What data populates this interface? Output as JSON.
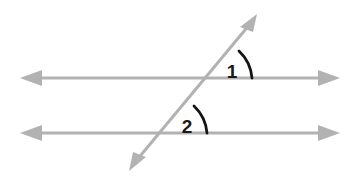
{
  "figure": {
    "width": 356,
    "height": 180,
    "background_color": "#ffffff",
    "line_color": "#b2b2b2",
    "arc_color": "#141414",
    "label_color": "#1a1a1a"
  },
  "lines": [
    {
      "name": "top-parallel-line",
      "role": "parallel-line",
      "orientation": "horizontal",
      "x1": 22,
      "y1": 78,
      "x2": 338,
      "y2": 78,
      "color": "#b2b2b2",
      "stroke_width": 3,
      "arrow_start": true,
      "arrow_end": true
    },
    {
      "name": "bottom-parallel-line",
      "role": "parallel-line",
      "orientation": "horizontal",
      "x1": 22,
      "y1": 133,
      "x2": 338,
      "y2": 133,
      "color": "#b2b2b2",
      "stroke_width": 3,
      "arrow_start": true,
      "arrow_end": true
    },
    {
      "name": "transversal-line",
      "role": "transversal",
      "orientation": "diagonal",
      "x1": 130,
      "y1": 168,
      "x2": 256,
      "y2": 16,
      "color": "#b2b2b2",
      "stroke_width": 3,
      "arrow_start": true,
      "arrow_end": true
    }
  ],
  "intersections": [
    {
      "name": "top-intersection",
      "x": 210,
      "y": 78
    },
    {
      "name": "bottom-intersection",
      "x": 165,
      "y": 133
    }
  ],
  "angles": [
    {
      "name": "angle-1",
      "label": "1",
      "vertex": {
        "x": 210,
        "y": 78
      },
      "radius": 40,
      "arc_path": "M 244 57 A 40 40 0 0 1 250 78",
      "label_x": 233,
      "label_y": 77,
      "color": "#141414",
      "stroke_width": 2.6
    },
    {
      "name": "angle-2",
      "label": "2",
      "vertex": {
        "x": 165,
        "y": 133
      },
      "radius": 40,
      "arc_path": "M 199 112 A 40 40 0 0 1 205 133",
      "label_x": 188,
      "label_y": 132,
      "color": "#141414",
      "stroke_width": 2.6
    }
  ],
  "arrowheads": [
    {
      "name": "arrowhead-top-line-left",
      "direction": "left"
    },
    {
      "name": "arrowhead-top-line-right",
      "direction": "right"
    },
    {
      "name": "arrowhead-bottom-line-left",
      "direction": "left"
    },
    {
      "name": "arrowhead-bottom-line-right",
      "direction": "right"
    },
    {
      "name": "arrowhead-transversal-upper-right",
      "direction": "up-right"
    },
    {
      "name": "arrowhead-transversal-lower-left",
      "direction": "down-left"
    }
  ]
}
